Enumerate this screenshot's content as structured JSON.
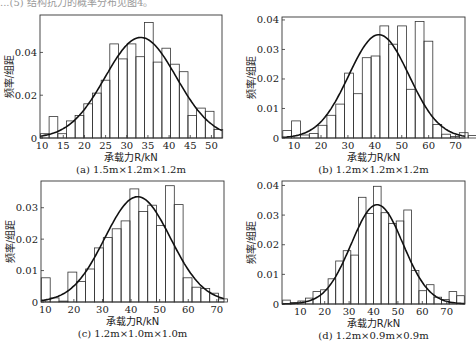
{
  "header": {
    "text": "...(5) 结构抗力的概率分布见图4。"
  },
  "chart_data": [
    {
      "type": "bar",
      "id": "a",
      "caption": "(a) 1.5m×1.2m×1.2m",
      "xlabel": "承载力R/kN",
      "ylabel": "频率/组距",
      "xlim": [
        9.5,
        52.5
      ],
      "ylim": [
        0,
        0.0575
      ],
      "xticks": [
        10,
        15,
        20,
        25,
        30,
        35,
        40,
        45,
        50
      ],
      "yticks": [
        0,
        0.02,
        0.04
      ],
      "ytick_labels": [
        "0",
        "0.02",
        "0.04"
      ],
      "bin_start": 9.6,
      "bin_width": 2.05,
      "series": [
        {
          "name": "histogram",
          "values": [
            0.002,
            0.01,
            0.002,
            0.008,
            0.0105,
            0.016,
            0.021,
            0.027,
            0.044,
            0.037,
            0.044,
            0.038,
            0.054,
            0.0355,
            0.042,
            0.0345,
            0.031,
            0.0105,
            0.014,
            0.0125,
            0.004
          ]
        },
        {
          "name": "normal-fit",
          "mean": 33.3,
          "peak": 0.047,
          "sd": 8.4
        }
      ]
    },
    {
      "type": "bar",
      "id": "b",
      "caption": "(b) 1.2m×1.2m×1.2m",
      "xlabel": "承载力R/kN",
      "ylabel": "频率/组距",
      "xlim": [
        5.5,
        73.5
      ],
      "ylim": [
        0,
        0.041
      ],
      "xticks": [
        10,
        20,
        30,
        40,
        50,
        60,
        70
      ],
      "yticks": [
        0,
        0.01,
        0.02,
        0.03,
        0.04
      ],
      "ytick_labels": [
        "0",
        "0.01",
        "0.02",
        "0.03",
        "0.04"
      ],
      "bin_start": 5.8,
      "bin_width": 3.28,
      "series": [
        {
          "name": "histogram",
          "values": [
            0.0025,
            0.0058,
            0.001,
            0.0015,
            0.0043,
            0.0077,
            0.0115,
            0.022,
            0.015,
            0.0272,
            0.0278,
            0.038,
            0.0318,
            0.038,
            0.0165,
            0.0395,
            0.0328,
            0.0046,
            0.0013,
            0.0005,
            0.0018,
            0.0008
          ]
        },
        {
          "name": "normal-fit",
          "mean": 41.5,
          "peak": 0.035,
          "sd": 11.2
        }
      ]
    },
    {
      "type": "bar",
      "id": "c",
      "caption": "(c) 1.2m×1.0m×1.0m",
      "xlabel": "承载力R/kN",
      "ylabel": "频率/组距",
      "xlim": [
        8.5,
        72.5
      ],
      "ylim": [
        0,
        0.0385
      ],
      "xticks": [
        10,
        20,
        30,
        40,
        50,
        60,
        70
      ],
      "yticks": [
        0,
        0.01,
        0.02,
        0.03
      ],
      "ytick_labels": [
        "0",
        "0.01",
        "0.02",
        "0.03"
      ],
      "bin_start": 8.6,
      "bin_width": 3.1,
      "series": [
        {
          "name": "histogram",
          "values": [
            0.0077,
            0.0013,
            0.0003,
            0.0095,
            0.0065,
            0.0105,
            0.0172,
            0.0205,
            0.0233,
            0.0258,
            0.036,
            0.0288,
            0.0308,
            0.0243,
            0.037,
            0.031,
            0.0077,
            0.0047,
            0.0043,
            0.0028,
            0.001
          ]
        },
        {
          "name": "normal-fit",
          "mean": 42.3,
          "peak": 0.0335,
          "sd": 11.5
        }
      ]
    },
    {
      "type": "bar",
      "id": "d",
      "caption": "(d) 1.2m×0.9m×0.9m",
      "xlabel": "承载力R/kN",
      "ylabel": "频率/组距",
      "xlim": [
        2.5,
        77.5
      ],
      "ylim": [
        0,
        0.0415
      ],
      "xticks": [
        10,
        20,
        30,
        40,
        50,
        60,
        70
      ],
      "yticks": [
        0,
        0.01,
        0.02,
        0.03,
        0.04
      ],
      "ytick_labels": [
        "0",
        "0.01",
        "0.02",
        "0.03",
        "0.04"
      ],
      "bin_start": 2.8,
      "bin_width": 3.1,
      "series": [
        {
          "name": "histogram",
          "values": [
            0.0013,
            0.0005,
            0.001,
            0.002,
            0.0042,
            0.0048,
            0.0085,
            0.0145,
            0.018,
            0.0165,
            0.036,
            0.0305,
            0.0397,
            0.0308,
            0.0272,
            0.028,
            0.0317,
            0.0113,
            0.0045,
            0.0065,
            0.0023,
            0.0015,
            0.0042,
            0.0028
          ]
        },
        {
          "name": "normal-fit",
          "mean": 41.5,
          "peak": 0.0335,
          "sd": 10.6
        }
      ]
    }
  ]
}
